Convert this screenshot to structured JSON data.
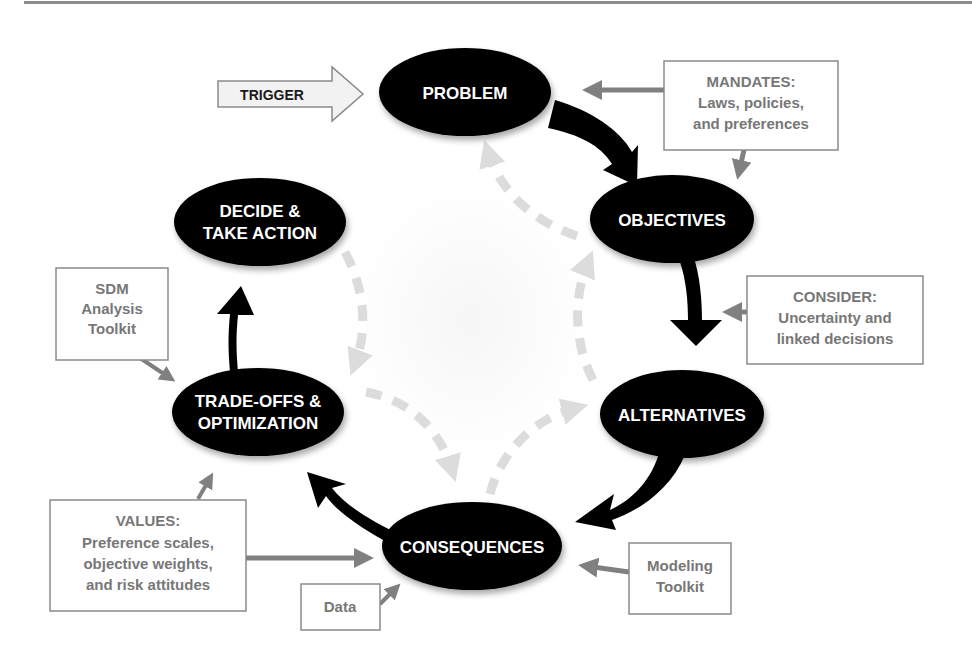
{
  "diagram": {
    "type": "structured-decision-making-cycle",
    "colors": {
      "node_fill": "#000000",
      "node_text": "#ffffff",
      "box_border": "#8a8a8a",
      "box_text": "#777777",
      "input_arrow": "#808080",
      "dashed_arrow": "#dcdcdc",
      "trigger_fill": "#f2f2f2",
      "top_rule": "#8c8c8c"
    },
    "trigger": {
      "label": "TRIGGER"
    },
    "nodes": [
      {
        "id": "problem",
        "lines": [
          "PROBLEM"
        ]
      },
      {
        "id": "objectives",
        "lines": [
          "OBJECTIVES"
        ]
      },
      {
        "id": "alternatives",
        "lines": [
          "ALTERNATIVES"
        ]
      },
      {
        "id": "consequences",
        "lines": [
          "CONSEQUENCES"
        ]
      },
      {
        "id": "tradeoffs",
        "lines": [
          "TRADE-OFFS &",
          "OPTIMIZATION"
        ]
      },
      {
        "id": "decide",
        "lines": [
          "DECIDE &",
          "TAKE ACTION"
        ]
      }
    ],
    "boxes": [
      {
        "id": "mandates",
        "lines": [
          "MANDATES:",
          "Laws, policies,",
          "and preferences"
        ],
        "feeds": [
          "problem",
          "objectives"
        ]
      },
      {
        "id": "consider",
        "lines": [
          "CONSIDER:",
          "Uncertainty and",
          "linked decisions"
        ],
        "feeds": [
          "objectives-alternatives-arrow"
        ]
      },
      {
        "id": "sdm-toolkit",
        "lines": [
          "SDM",
          "Analysis",
          "Toolkit"
        ],
        "feeds": [
          "tradeoffs"
        ]
      },
      {
        "id": "values",
        "lines": [
          "VALUES:",
          "Preference scales,",
          "objective weights,",
          "and risk attitudes"
        ],
        "feeds": [
          "tradeoffs",
          "consequences"
        ]
      },
      {
        "id": "data",
        "lines": [
          "Data"
        ],
        "feeds": [
          "consequences"
        ]
      },
      {
        "id": "modeling-toolkit",
        "lines": [
          "Modeling",
          "Toolkit"
        ],
        "feeds": [
          "consequences"
        ]
      }
    ],
    "cycle_order": [
      "problem",
      "objectives",
      "alternatives",
      "consequences",
      "tradeoffs",
      "decide"
    ],
    "feedback_arrows": [
      {
        "from": "objectives",
        "to": "problem",
        "style": "dashed"
      },
      {
        "from": "alternatives",
        "to": "objectives",
        "style": "dashed"
      },
      {
        "from": "consequences",
        "to": "alternatives",
        "style": "dashed"
      },
      {
        "from": "tradeoffs",
        "to": "consequences",
        "style": "dashed"
      },
      {
        "from": "decide",
        "to": "tradeoffs",
        "style": "dashed"
      }
    ]
  }
}
